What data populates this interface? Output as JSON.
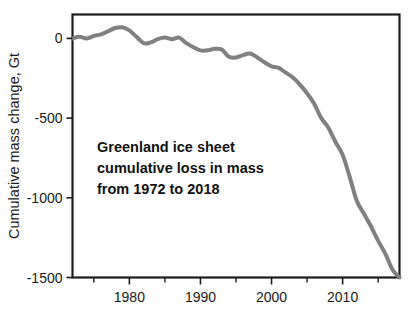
{
  "chart_data": {
    "type": "line",
    "title": "",
    "subtitle": "",
    "xlabel": "",
    "ylabel": "Cumulative mass change, Gt",
    "annotation": {
      "lines": [
        "Greenland ice sheet",
        "cumulative loss in mass",
        "from 1972 to 2018"
      ]
    },
    "xlim": [
      1972,
      2018
    ],
    "ylim": [
      -1500,
      150
    ],
    "grid": true,
    "legend": false,
    "legend_position": "none",
    "x_ticks_major": [
      1980,
      1990,
      2000,
      2010
    ],
    "x_tick_labels": [
      "1980",
      "1990",
      "2000",
      "2010"
    ],
    "x_ticks_minor": [
      1975,
      1985,
      1995,
      2005,
      2015
    ],
    "y_ticks": [
      0,
      -500,
      -1000,
      -1500
    ],
    "y_tick_labels": [
      "0",
      "-500",
      "-1000",
      "-1500"
    ],
    "series": [
      {
        "name": "Greenland cumulative mass change",
        "color": "#808080",
        "line_width": 4,
        "x": [
          1972,
          1973,
          1974,
          1975,
          1976,
          1977,
          1978,
          1979,
          1980,
          1981,
          1982,
          1983,
          1984,
          1985,
          1986,
          1987,
          1988,
          1989,
          1990,
          1991,
          1992,
          1993,
          1994,
          1995,
          1996,
          1997,
          1998,
          1999,
          2000,
          2001,
          2002,
          2003,
          2004,
          2005,
          2006,
          2007,
          2008,
          2009,
          2010,
          2011,
          2012,
          2013,
          2014,
          2015,
          2016,
          2017,
          2018
        ],
        "values": [
          0,
          10,
          0,
          15,
          25,
          45,
          65,
          70,
          50,
          10,
          -30,
          -25,
          -5,
          5,
          -5,
          5,
          -30,
          -55,
          -75,
          -75,
          -65,
          -70,
          -115,
          -120,
          -105,
          -95,
          -120,
          -150,
          -175,
          -185,
          -215,
          -245,
          -290,
          -345,
          -410,
          -500,
          -560,
          -650,
          -730,
          -870,
          -1020,
          -1100,
          -1180,
          -1270,
          -1350,
          -1450,
          -1500
        ]
      }
    ]
  }
}
